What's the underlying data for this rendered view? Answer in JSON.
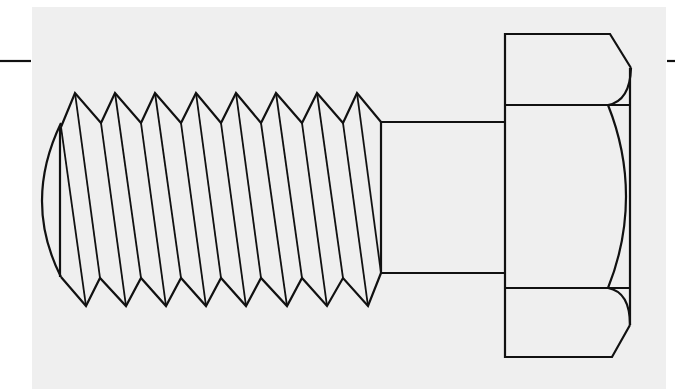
{
  "figure": {
    "colors": {
      "paper": "#efefef",
      "background": "#ffffff",
      "line": "#111111"
    },
    "stroke_width": 2.2,
    "center_marks": {
      "left": {
        "x1": 0,
        "x2": 31,
        "y": 61
      },
      "right": {
        "x1": 667,
        "x2": 675,
        "y": 61
      }
    },
    "thread": {
      "start_top": [
        61,
        127
      ],
      "start_bottom": [
        61,
        277
      ],
      "end_top": [
        381,
        122
      ],
      "end_bottom": [
        381,
        273
      ],
      "top_peaks_x": [
        75,
        115,
        155,
        196,
        236,
        276,
        317,
        357
      ],
      "top_peak_y": 93,
      "top_valleys_x": [
        101,
        141,
        181,
        221,
        261,
        302,
        343
      ],
      "top_valley_y": 123,
      "bottom_points_x": [
        86,
        126,
        166,
        206,
        246,
        287,
        327,
        368
      ],
      "bottom_point_y": 306,
      "bottom_valleys_x": [
        100,
        141,
        181,
        221,
        261,
        302,
        343
      ],
      "bottom_valley_y": 278,
      "end_arc_bulge_x": 43
    },
    "shank": {
      "x1": 381,
      "x2": 505,
      "top_y": 122,
      "bottom_y": 273
    },
    "head": {
      "left_x": 505,
      "right_x": 630,
      "top_y": 34,
      "bottom_y": 357,
      "top_chamfer": {
        "from": [
          610,
          34
        ],
        "to": [
          631,
          68
        ]
      },
      "bottom_chamfer": {
        "from": [
          612,
          357
        ],
        "to": [
          630,
          325
        ]
      },
      "upper_divider_y": 105,
      "lower_divider_y": 288,
      "arc_x": 608
    }
  }
}
